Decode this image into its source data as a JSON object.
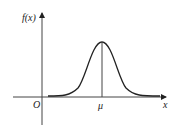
{
  "diagram": {
    "type": "normal-distribution-curve",
    "labels": {
      "y_axis": "f(x)",
      "x_axis": "x",
      "origin": "O",
      "mean": "μ"
    },
    "colors": {
      "stroke": "#222222",
      "background": "#ffffff"
    }
  }
}
